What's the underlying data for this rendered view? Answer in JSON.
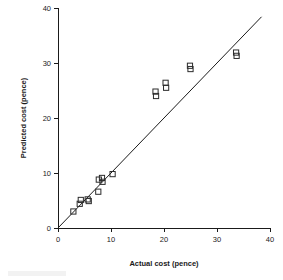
{
  "chart_data": {
    "type": "scatter",
    "title": "",
    "xlabel": "Actual cost (pence)",
    "ylabel": "Predicted cost (pence)",
    "xlim": [
      0,
      40
    ],
    "ylim": [
      0,
      40
    ],
    "xticks": [
      0,
      10,
      20,
      30,
      40
    ],
    "yticks": [
      0,
      10,
      20,
      30,
      40
    ],
    "xtick_labels": [
      "0",
      "10",
      "20",
      "30",
      "40"
    ],
    "ytick_labels": [
      "0",
      "10",
      "20",
      "30",
      "40"
    ],
    "grid": false,
    "legend": null,
    "marker": "open-square",
    "series": [
      {
        "name": "Predicted vs actual cost",
        "points": [
          {
            "x": 2.9,
            "y": 3.0
          },
          {
            "x": 4.1,
            "y": 4.4
          },
          {
            "x": 4.3,
            "y": 5.1
          },
          {
            "x": 5.6,
            "y": 5.2
          },
          {
            "x": 5.8,
            "y": 4.9
          },
          {
            "x": 7.6,
            "y": 6.6
          },
          {
            "x": 7.7,
            "y": 8.8
          },
          {
            "x": 8.3,
            "y": 9.1
          },
          {
            "x": 8.4,
            "y": 8.4
          },
          {
            "x": 10.3,
            "y": 9.8
          },
          {
            "x": 18.4,
            "y": 24.8
          },
          {
            "x": 18.5,
            "y": 24.0
          },
          {
            "x": 20.3,
            "y": 26.4
          },
          {
            "x": 20.4,
            "y": 25.5
          },
          {
            "x": 24.9,
            "y": 29.5
          },
          {
            "x": 25.0,
            "y": 28.9
          },
          {
            "x": 33.6,
            "y": 31.9
          },
          {
            "x": 33.7,
            "y": 31.3
          }
        ]
      }
    ],
    "reference_line": {
      "name": "identity line",
      "x0": 0,
      "y0": 0,
      "x1": 38.4,
      "y1": 38.4
    }
  }
}
